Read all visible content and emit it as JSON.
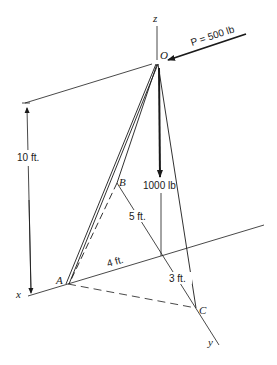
{
  "diagram": {
    "type": "3d-tripod-statics",
    "points": {
      "O": {
        "label": "O"
      },
      "A": {
        "label": "A"
      },
      "B": {
        "label": "B"
      },
      "C": {
        "label": "C"
      }
    },
    "axes": {
      "x": "x",
      "y": "y",
      "z": "z"
    },
    "forces": {
      "P": {
        "label": "P = 500 lb"
      },
      "W": {
        "label": "1000 lb"
      }
    },
    "dimensions": {
      "height": "10 ft.",
      "b_offset": "5 ft.",
      "a_offset": "4 ft.",
      "c_offset": "3 ft."
    },
    "colors": {
      "ink": "#1a1a1a",
      "background": "#ffffff"
    }
  }
}
